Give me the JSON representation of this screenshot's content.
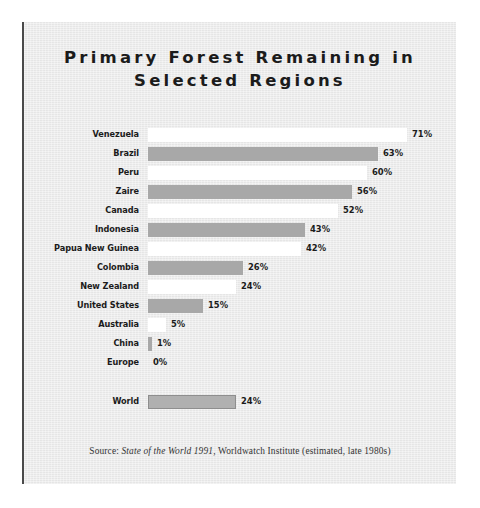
{
  "figure": {
    "title": "Primary Forest Remaining in\nSelected Regions",
    "source_prefix": "Source: ",
    "source_book": "State of the World 1991",
    "source_rest": ", Worldwatch Institute (estimated, late 1980s)",
    "colors": {
      "panel_background": "#ebebeb",
      "bar_gray": "#a8a8a8",
      "bar_white": "#ffffff",
      "world_bar": "#b0b0b0",
      "text": "#1b1b1b",
      "left_rule": "#4a4a4a"
    }
  },
  "chart_data": {
    "type": "bar",
    "orientation": "horizontal",
    "title": "Primary Forest Remaining in Selected Regions",
    "xlabel": "",
    "ylabel": "",
    "xlim": [
      0,
      71
    ],
    "grid": false,
    "legend": null,
    "unit": "%",
    "categories": [
      "Venezuela",
      "Brazil",
      "Peru",
      "Zaire",
      "Canada",
      "Indonesia",
      "Papua New Guinea",
      "Colombia",
      "New Zealand",
      "United States",
      "Australia",
      "China",
      "Europe",
      "World"
    ],
    "values": [
      71,
      63,
      60,
      56,
      52,
      43,
      42,
      26,
      24,
      15,
      5,
      1,
      0,
      24
    ],
    "data_labels": [
      "71%",
      "63%",
      "60%",
      "56%",
      "52%",
      "43%",
      "42%",
      "26%",
      "24%",
      "15%",
      "5%",
      "1%",
      "0%",
      "24%"
    ],
    "bar_fills": [
      "white",
      "gray",
      "white",
      "gray",
      "white",
      "gray",
      "white",
      "gray",
      "white",
      "gray",
      "white",
      "gray",
      "white",
      "world"
    ],
    "annotations": [
      "Source: State of the World 1991, Worldwatch Institute (estimated, late 1980s)"
    ]
  }
}
